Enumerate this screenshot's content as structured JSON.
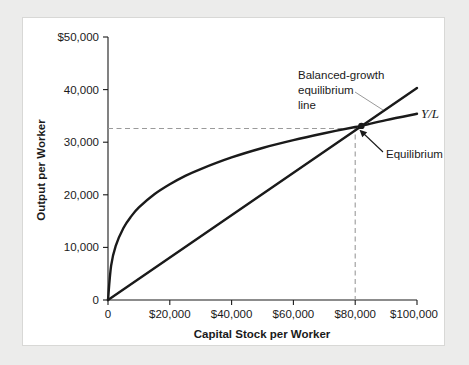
{
  "figure": {
    "background_color": "#ececeb",
    "panel_color": "#ffffff",
    "panel_border_color": "#d8d8d6",
    "ink_color": "#1a1a1a",
    "guide_color": "#9a9a9a"
  },
  "chart_data": {
    "type": "line",
    "title": "",
    "xlabel": "Capital Stock per Worker",
    "ylabel": "Output per Worker",
    "xlim": [
      0,
      100000
    ],
    "ylim": [
      0,
      50000
    ],
    "grid": false,
    "legend_position": "inline-labels",
    "x_ticks": [
      0,
      20000,
      40000,
      60000,
      80000,
      100000
    ],
    "x_tick_labels": [
      "0",
      "$20,000",
      "$40,000",
      "$60,000",
      "$80,000",
      "$100,000"
    ],
    "y_ticks": [
      0,
      10000,
      20000,
      30000,
      40000,
      50000
    ],
    "y_tick_labels": [
      "0",
      "10,000",
      "20,000",
      "30,000",
      "40,000",
      "$50,000"
    ],
    "series": [
      {
        "name": "Y/L",
        "label": "Y/L",
        "kind": "production-function",
        "description": "Concave per-worker production function",
        "x": [
          0,
          1000,
          2500,
          5000,
          7500,
          10000,
          15000,
          20000,
          25000,
          30000,
          40000,
          50000,
          60000,
          70000,
          80000,
          82000,
          90000,
          100000
        ],
        "y": [
          0,
          6500,
          10300,
          13700,
          15900,
          17600,
          20100,
          22000,
          23600,
          24900,
          27100,
          28900,
          30400,
          31700,
          32900,
          33100,
          34200,
          35400
        ]
      },
      {
        "name": "Balanced-growth equilibrium line",
        "label": "Balanced-growth equilibrium line",
        "kind": "ray-from-origin",
        "description": "Straight line through the origin",
        "x": [
          0,
          100000
        ],
        "y": [
          0,
          40300
        ]
      }
    ],
    "annotations": [
      {
        "name": "equilibrium-point",
        "label": "Equilibrium",
        "x": 82000,
        "y": 33100,
        "marker": "dot"
      },
      {
        "name": "balanced-growth-label",
        "label": "Balanced-growth equilibrium line",
        "lines": [
          "Balanced-growth",
          "equilibrium",
          "line"
        ]
      },
      {
        "name": "series-label-yl",
        "label": "Y/L"
      }
    ],
    "guides": [
      {
        "name": "equilibrium-output-guide",
        "orientation": "horizontal",
        "value": 32600,
        "style": "dashed"
      },
      {
        "name": "equilibrium-capital-guide",
        "orientation": "vertical",
        "value": 80000,
        "style": "dashed"
      }
    ]
  }
}
